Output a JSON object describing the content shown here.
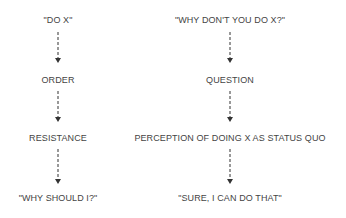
{
  "left_column": {
    "nodes": [
      {
        "label": "\"DO X\""
      },
      {
        "label": "ORDER"
      },
      {
        "label": "RESISTANCE"
      },
      {
        "label": "\"WHY SHOULD I?\""
      }
    ]
  },
  "right_column": {
    "nodes": [
      {
        "label": "\"WHY DON'T YOU DO X?\""
      },
      {
        "label": "QUESTION"
      },
      {
        "label": "PERCEPTION OF DOING X AS STATUS QUO"
      },
      {
        "label": "\"SURE, I CAN DO THAT\""
      }
    ]
  },
  "colors": {
    "text": "#444444",
    "arrow": "#333333",
    "background": "#ffffff"
  },
  "icons": {
    "connector": "dashed-down-arrow-icon"
  }
}
